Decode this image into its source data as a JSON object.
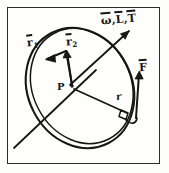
{
  "figure": {
    "kind": "hand-drawn-physics-diagram",
    "frame_color": "#2b2b2b",
    "ink_color": "#161616",
    "background_color": "#fefefc"
  },
  "labels": {
    "axis_vectors": {
      "text": "ω, L, T",
      "omega": "ω",
      "angular_momentum": "L",
      "torque": "T",
      "separator": ","
    },
    "vector_r1": {
      "base": "r",
      "subscript": "1"
    },
    "vector_r2": {
      "base": "r",
      "subscript": "2"
    },
    "point_p": "P",
    "force": "F",
    "radius": "r"
  },
  "elements": {
    "disk": "ellipse-disk-rim",
    "center_point": "point-P",
    "axis_line": "rotation-axis-line",
    "right_angle_marker": "right-angle-square",
    "arrow_axis": "axis-vector-arrow",
    "arrow_r1": "r1-vector-arrow",
    "arrow_r2": "r2-vector-arrow",
    "arrow_force": "force-vector-arrow"
  }
}
